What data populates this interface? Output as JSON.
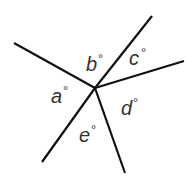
{
  "diagram": {
    "type": "angles-around-a-point",
    "center": {
      "x": 95,
      "y": 88
    },
    "rays": [
      {
        "name": "upper-left",
        "x": 14,
        "y": 43
      },
      {
        "name": "upper-right",
        "x": 152,
        "y": 16
      },
      {
        "name": "right",
        "x": 184,
        "y": 61
      },
      {
        "name": "bottom",
        "x": 125,
        "y": 173
      },
      {
        "name": "lower-left",
        "x": 42,
        "y": 162
      }
    ],
    "labels": {
      "a": {
        "letter": "a",
        "degree": "°"
      },
      "b": {
        "letter": "b",
        "degree": "°"
      },
      "c": {
        "letter": "c",
        "degree": "°"
      },
      "d": {
        "letter": "d",
        "degree": "°"
      },
      "e": {
        "letter": "e",
        "degree": "°"
      }
    }
  }
}
